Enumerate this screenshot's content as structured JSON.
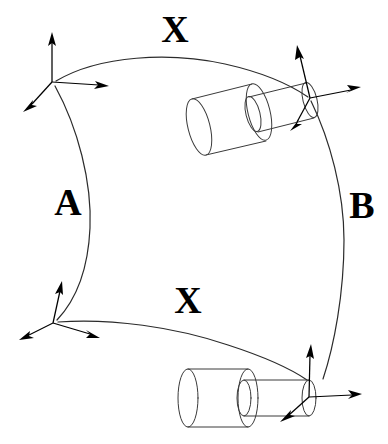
{
  "figure": {
    "background_color": "#ffffff",
    "line_color": "#2b2b2b",
    "label_color": "#000000",
    "width": 388,
    "height": 444
  },
  "labels": {
    "top_transform": "X",
    "bottom_transform": "X",
    "left_transform": "A",
    "right_transform": "B"
  },
  "label_positions": {
    "top_transform": {
      "x": 175,
      "y": 42
    },
    "bottom_transform": {
      "x": 188,
      "y": 313
    },
    "left_transform": {
      "x": 68,
      "y": 215
    },
    "right_transform": {
      "x": 362,
      "y": 218
    }
  },
  "frames": [
    {
      "name": "top-left-frame",
      "origin": {
        "x": 52,
        "y": 82
      },
      "axes": [
        {
          "name": "axis-up",
          "tip": {
            "x": 52,
            "y": 33
          }
        },
        {
          "name": "axis-right",
          "tip": {
            "x": 108,
            "y": 86
          }
        },
        {
          "name": "axis-down-left",
          "tip": {
            "x": 24,
            "y": 111
          }
        }
      ]
    },
    {
      "name": "bottom-left-frame",
      "origin": {
        "x": 53,
        "y": 323
      },
      "axes": [
        {
          "name": "axis-up",
          "tip": {
            "x": 61,
            "y": 282
          }
        },
        {
          "name": "axis-down-left",
          "tip": {
            "x": 20,
            "y": 339
          }
        },
        {
          "name": "axis-down-right",
          "tip": {
            "x": 99,
            "y": 338
          }
        }
      ]
    },
    {
      "name": "top-right-frame",
      "origin": {
        "x": 310,
        "y": 98
      },
      "axes": [
        {
          "name": "axis-up",
          "tip": {
            "x": 297,
            "y": 46
          }
        },
        {
          "name": "axis-right",
          "tip": {
            "x": 360,
            "y": 88
          }
        },
        {
          "name": "axis-down-left",
          "tip": {
            "x": 290,
            "y": 130
          }
        }
      ]
    },
    {
      "name": "bottom-right-frame",
      "origin": {
        "x": 309,
        "y": 397
      },
      "axes": [
        {
          "name": "axis-up",
          "tip": {
            "x": 311,
            "y": 345
          }
        },
        {
          "name": "axis-right",
          "tip": {
            "x": 361,
            "y": 394
          }
        },
        {
          "name": "axis-down-left",
          "tip": {
            "x": 281,
            "y": 421
          }
        }
      ]
    }
  ],
  "surface_edges": {
    "top_edge": {
      "from": "top-left-frame",
      "to": "top-right-frame",
      "label": "X"
    },
    "bottom_edge": {
      "from": "bottom-left-frame",
      "to": "bottom-right-frame",
      "label": "X"
    },
    "left_edge": {
      "from": "top-left-frame",
      "to": "bottom-left-frame",
      "label": "A"
    },
    "right_edge": {
      "from": "top-right-frame",
      "to": "bottom-right-frame",
      "label": "B"
    }
  },
  "cylinders": [
    {
      "name": "top-peg-assembly",
      "body_label": "camera-body",
      "tip_frame": "top-right-frame"
    },
    {
      "name": "bottom-peg-assembly",
      "body_label": "camera-body",
      "tip_frame": "bottom-right-frame"
    }
  ]
}
